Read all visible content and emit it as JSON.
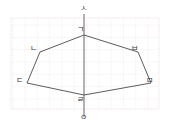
{
  "figure": {
    "type": "geometry-diagram",
    "width": 169,
    "height": 131,
    "colors": {
      "background": "#ffffff",
      "grid": "#e3cfd2",
      "stroke": "#4a4a4a",
      "label": "#3a3a3a"
    },
    "grid": {
      "visible": true,
      "left": 11,
      "top": 18,
      "right": 159,
      "bottom": 109,
      "cell": 12.3
    },
    "axis": {
      "name": "vertical-axis",
      "x": 84,
      "y_top": 14,
      "y_bottom": 117,
      "top_label": "ㅅ",
      "bottom_label": "ㅇ"
    },
    "polygon": {
      "name": "hexagon",
      "points": "84,35 40,52 27,83 84,95 151,83 138,52",
      "vertices": [
        {
          "label": "ㄱ",
          "x": 84,
          "y": 35,
          "label_x": 77,
          "label_y": 26
        },
        {
          "label": "ㄴ",
          "x": 40,
          "y": 52,
          "label_x": 30,
          "label_y": 45
        },
        {
          "label": "ㄷ",
          "x": 27,
          "y": 83,
          "label_x": 16,
          "label_y": 77
        },
        {
          "label": "ㄹ",
          "x": 84,
          "y": 95,
          "label_x": 77,
          "label_y": 96
        },
        {
          "label": "ㅁ",
          "x": 151,
          "y": 83,
          "label_x": 146,
          "label_y": 77
        },
        {
          "label": "ㅂ",
          "x": 138,
          "y": 52,
          "label_x": 131,
          "label_y": 45
        }
      ]
    },
    "labels": {
      "axis_top": {
        "text": "ㅅ",
        "x": 80,
        "y": 7
      },
      "axis_bottom": {
        "text": "ㅇ",
        "x": 80,
        "y": 114
      }
    }
  }
}
